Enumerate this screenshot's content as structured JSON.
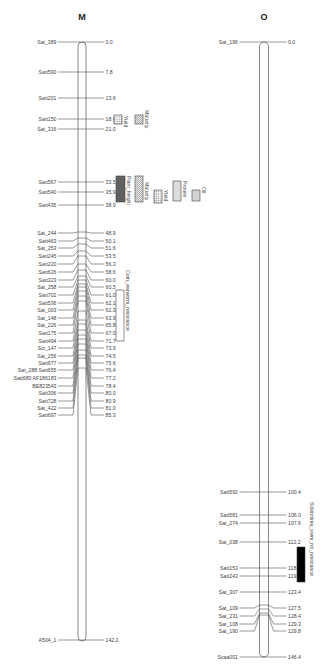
{
  "chart_data": {
    "type": "genetic-linkage-map",
    "chromosomes": [
      {
        "name": "M",
        "length_cM": 142.2,
        "markers": [
          {
            "name": "Sat_389",
            "pos": 0.0,
            "label": "0.0"
          },
          {
            "name": "Satt590",
            "pos": 7.8,
            "label": "7.8"
          },
          {
            "name": "Satt201",
            "pos": 13.6,
            "label": "13.6"
          },
          {
            "name": "Satt150",
            "pos": 18.6,
            "label": "18.6"
          },
          {
            "name": "Sat_316",
            "pos": 21.0,
            "label": "21.0"
          },
          {
            "name": "Satt567",
            "pos": 33.5,
            "label": "33.5"
          },
          {
            "name": "Satt540",
            "pos": 35.9,
            "label": "35.9"
          },
          {
            "name": "Satt435",
            "pos": 38.9,
            "label": "38.9"
          },
          {
            "name": "Sat_244",
            "pos": 48.9,
            "label": "48.9"
          },
          {
            "name": "Satt463",
            "pos": 50.1,
            "label": "50.1"
          },
          {
            "name": "Sat_253",
            "pos": 51.6,
            "label": "51.6"
          },
          {
            "name": "Satt245",
            "pos": 53.5,
            "label": "53.5"
          },
          {
            "name": "Satt220",
            "pos": 56.3,
            "label": "56.3"
          },
          {
            "name": "Satt626",
            "pos": 58.6,
            "label": "58.6"
          },
          {
            "name": "Satt323",
            "pos": 60.0,
            "label": "60.0"
          },
          {
            "name": "Sat_258",
            "pos": 60.5,
            "label": "60.5"
          },
          {
            "name": "Satt702",
            "pos": 61.0,
            "label": "61.0"
          },
          {
            "name": "Satt536",
            "pos": 62.1,
            "label": "62.1"
          },
          {
            "name": "Sat_003",
            "pos": 62.3,
            "label": "62.3"
          },
          {
            "name": "Sat_148",
            "pos": 63.9,
            "label": "63.9"
          },
          {
            "name": "Sat_226",
            "pos": 65.8,
            "label": "65.8"
          },
          {
            "name": "Satt175",
            "pos": 67.0,
            "label": "67.0"
          },
          {
            "name": "Satt494",
            "pos": 71.7,
            "label": "71.7"
          },
          {
            "name": "Sct_147",
            "pos": 73.9,
            "label": "73.9"
          },
          {
            "name": "Sat_256",
            "pos": 74.5,
            "label": "74.5"
          },
          {
            "name": "Satt677",
            "pos": 75.6,
            "label": "75.6"
          },
          {
            "name": "Sat_288 Satt655",
            "pos": 76.4,
            "label": "76.4"
          },
          {
            "name": "Satt680 AF186183",
            "pos": 77.2,
            "label": "77.2"
          },
          {
            "name": "BE823543",
            "pos": 78.4,
            "label": "78.4"
          },
          {
            "name": "Satt306",
            "pos": 80.0,
            "label": "80.0"
          },
          {
            "name": "Satt728",
            "pos": 80.9,
            "label": "80.9"
          },
          {
            "name": "Sat_422",
            "pos": 81.0,
            "label": "81.0"
          },
          {
            "name": "Satt697",
            "pos": 85.3,
            "label": "85.3"
          },
          {
            "name": "A504_1",
            "pos": 142.2,
            "label": "142.2"
          }
        ],
        "qtls": [
          {
            "trait": "Yield",
            "pattern": "grid",
            "from": 18.6,
            "to": 21.0
          },
          {
            "trait": "Maturity",
            "pattern": "diag",
            "from": 18.6,
            "to": 21.0
          },
          {
            "trait": "Plant_height",
            "pattern": "cross-dark",
            "from": 33.5,
            "to": 38.9
          },
          {
            "trait": "Maturity",
            "pattern": "diag",
            "from": 33.5,
            "to": 38.9
          },
          {
            "trait": "Yield",
            "pattern": "grid",
            "from": 35.9,
            "to": 38.9
          },
          {
            "trait": "Protein",
            "pattern": "vstripe",
            "from": 33.5,
            "to": 38.9
          },
          {
            "trait": "Oil",
            "pattern": "hstripe",
            "from": 35.9,
            "to": 38.9
          },
          {
            "trait": "Corn_earworm_resistance",
            "pattern": "empty",
            "from": 61.0,
            "to": 71.7
          }
        ]
      },
      {
        "name": "O",
        "length_cM": 146.4,
        "markers": [
          {
            "name": "Sat_196",
            "pos": 0.0,
            "label": "0.0"
          },
          {
            "name": "Satt592",
            "pos": 100.4,
            "label": "100.4"
          },
          {
            "name": "Satt581",
            "pos": 106.0,
            "label": "106.0"
          },
          {
            "name": "Sat_274",
            "pos": 107.6,
            "label": "107.6"
          },
          {
            "name": "Sat_038",
            "pos": 112.2,
            "label": "112.2"
          },
          {
            "name": "Satt153",
            "pos": 118.1,
            "label": "118.1"
          },
          {
            "name": "Satt243",
            "pos": 119.5,
            "label": "119.5"
          },
          {
            "name": "Sat_307",
            "pos": 123.4,
            "label": "123.4"
          },
          {
            "name": "Sat_109",
            "pos": 127.5,
            "label": "127.5"
          },
          {
            "name": "Sat_231",
            "pos": 128.4,
            "label": "128.4"
          },
          {
            "name": "Sat_108",
            "pos": 129.3,
            "label": "129.3"
          },
          {
            "name": "Sat_190",
            "pos": 129.8,
            "label": "129.8"
          },
          {
            "name": "Scaa001",
            "pos": 146.4,
            "label": "146.4"
          }
        ],
        "qtls": [
          {
            "trait": "Sclerotinia_stem_rot_resistance",
            "pattern": "solid",
            "from": 119.5,
            "to": 129.3
          }
        ]
      }
    ],
    "title": "",
    "colors": {
      "line": "#555555",
      "qtl_solid": "#000000",
      "qtl_dark": "#666666"
    }
  }
}
